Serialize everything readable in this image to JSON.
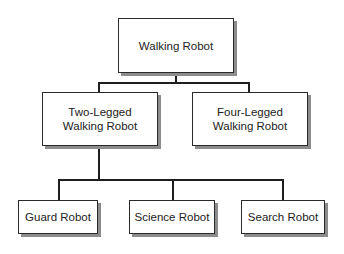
{
  "diagram": {
    "type": "hierarchy",
    "nodes": [
      {
        "id": "walking-robot",
        "label": "Walking Robot",
        "parent": null
      },
      {
        "id": "two-legged",
        "label": "Two-Legged\nWalking Robot",
        "parent": "walking-robot"
      },
      {
        "id": "four-legged",
        "label": "Four-Legged\nWalking Robot",
        "parent": "walking-robot"
      },
      {
        "id": "guard-robot",
        "label": "Guard Robot",
        "parent": "two-legged"
      },
      {
        "id": "science-robot",
        "label": "Science Robot",
        "parent": "two-legged"
      },
      {
        "id": "search-robot",
        "label": "Search Robot",
        "parent": "two-legged"
      }
    ]
  },
  "colors": {
    "border": "#2a2a2a",
    "shadow": "#8c8c8c",
    "line": "#1e1e1e",
    "text": "#222222",
    "background": "#ffffff"
  }
}
